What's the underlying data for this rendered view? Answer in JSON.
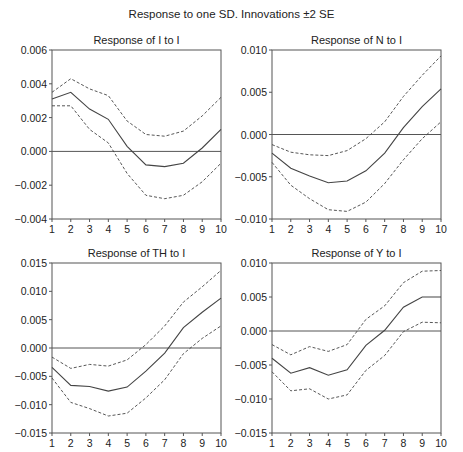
{
  "title": "Response to one SD. Innovations ±2 SE",
  "chart_data": [
    {
      "type": "line",
      "title": "Response of I to I",
      "x": [
        1,
        2,
        3,
        4,
        5,
        6,
        7,
        8,
        9,
        10
      ],
      "ylim": [
        -0.004,
        0.006
      ],
      "yticks": [
        -0.004,
        -0.002,
        0.0,
        0.002,
        0.004,
        0.006
      ],
      "ytick_labels": [
        "-0.004",
        "-0.002",
        "0.000",
        "0.002",
        "0.004",
        "0.006"
      ],
      "series": [
        {
          "name": "response",
          "style": "solid",
          "values": [
            0.0031,
            0.0035,
            0.0025,
            0.0019,
            0.0003,
            -0.0008,
            -0.0009,
            -0.0007,
            0.0002,
            0.0013
          ]
        },
        {
          "name": "upper_2se",
          "style": "dashed",
          "values": [
            0.0035,
            0.0043,
            0.0037,
            0.0033,
            0.0018,
            0.001,
            0.0009,
            0.0012,
            0.0021,
            0.0032
          ]
        },
        {
          "name": "lower_2se",
          "style": "dashed",
          "values": [
            0.0027,
            0.0027,
            0.0013,
            0.0005,
            -0.0013,
            -0.0026,
            -0.0028,
            -0.0026,
            -0.0018,
            -0.0007
          ]
        }
      ],
      "frame": {
        "x0": 52,
        "x1": 221,
        "y0": 50,
        "y1": 219
      }
    },
    {
      "type": "line",
      "title": "Response of N to I",
      "x": [
        1,
        2,
        3,
        4,
        5,
        6,
        7,
        8,
        9,
        10
      ],
      "ylim": [
        -0.01,
        0.01
      ],
      "yticks": [
        -0.01,
        -0.005,
        0.0,
        0.005,
        0.01
      ],
      "ytick_labels": [
        "-0.010",
        "-0.005",
        "0.000",
        "0.005",
        "0.010"
      ],
      "series": [
        {
          "name": "response",
          "style": "solid",
          "values": [
            -0.0022,
            -0.004,
            -0.0049,
            -0.0057,
            -0.0055,
            -0.0043,
            -0.0022,
            0.0008,
            0.0033,
            0.0054
          ]
        },
        {
          "name": "upper_2se",
          "style": "dashed",
          "values": [
            -0.0012,
            -0.0021,
            -0.0024,
            -0.0025,
            -0.0019,
            -0.0005,
            0.0015,
            0.0045,
            0.007,
            0.0093
          ]
        },
        {
          "name": "lower_2se",
          "style": "dashed",
          "values": [
            -0.0033,
            -0.006,
            -0.0076,
            -0.0089,
            -0.0091,
            -0.008,
            -0.0058,
            -0.003,
            -0.0005,
            0.0015
          ]
        }
      ],
      "frame": {
        "x0": 272,
        "x1": 441,
        "y0": 50,
        "y1": 219
      }
    },
    {
      "type": "line",
      "title": "Response of TH to I",
      "x": [
        1,
        2,
        3,
        4,
        5,
        6,
        7,
        8,
        9,
        10
      ],
      "ylim": [
        -0.015,
        0.015
      ],
      "yticks": [
        -0.015,
        -0.01,
        -0.005,
        0.0,
        0.005,
        0.01,
        0.015
      ],
      "ytick_labels": [
        "-0.015",
        "-0.010",
        "-0.005",
        "0.000",
        "0.005",
        "0.010",
        "0.015"
      ],
      "series": [
        {
          "name": "response",
          "style": "solid",
          "values": [
            -0.0034,
            -0.0066,
            -0.0068,
            -0.0076,
            -0.0069,
            -0.0041,
            -0.0009,
            0.0036,
            0.0063,
            0.0088
          ]
        },
        {
          "name": "upper_2se",
          "style": "dashed",
          "values": [
            -0.0016,
            -0.0036,
            -0.0029,
            -0.0032,
            -0.0021,
            0.0006,
            0.0039,
            0.0081,
            0.0108,
            0.0137
          ]
        },
        {
          "name": "lower_2se",
          "style": "dashed",
          "values": [
            -0.0053,
            -0.0096,
            -0.0107,
            -0.012,
            -0.0115,
            -0.0088,
            -0.0056,
            -0.001,
            0.0017,
            0.0039
          ]
        }
      ],
      "frame": {
        "x0": 52,
        "x1": 221,
        "y0": 263,
        "y1": 433
      }
    },
    {
      "type": "line",
      "title": "Response of Y to I",
      "x": [
        1,
        2,
        3,
        4,
        5,
        6,
        7,
        8,
        9,
        10
      ],
      "ylim": [
        -0.015,
        0.01
      ],
      "yticks": [
        -0.015,
        -0.01,
        -0.005,
        0.0,
        0.005,
        0.01
      ],
      "ytick_labels": [
        "-0.015",
        "-0.010",
        "-0.005",
        "0.000",
        "0.005",
        "0.010"
      ],
      "series": [
        {
          "name": "response",
          "style": "solid",
          "values": [
            -0.004,
            -0.0062,
            -0.0054,
            -0.0065,
            -0.0057,
            -0.0021,
            0.0001,
            0.0035,
            0.005,
            0.005
          ]
        },
        {
          "name": "upper_2se",
          "style": "dashed",
          "values": [
            -0.002,
            -0.0035,
            -0.0023,
            -0.003,
            -0.002,
            0.0017,
            0.0037,
            0.0071,
            0.0088,
            0.0089
          ]
        },
        {
          "name": "lower_2se",
          "style": "dashed",
          "values": [
            -0.006,
            -0.0088,
            -0.0085,
            -0.01,
            -0.0094,
            -0.0058,
            -0.0036,
            -0.0001,
            0.0013,
            0.0012
          ]
        }
      ],
      "frame": {
        "x0": 272,
        "x1": 441,
        "y0": 263,
        "y1": 433
      }
    }
  ]
}
